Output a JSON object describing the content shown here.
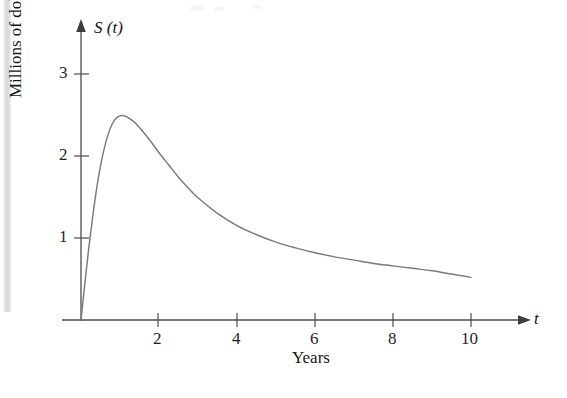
{
  "chart_data": {
    "type": "line",
    "title": "",
    "subtitle": "",
    "xlabel": "Years",
    "ylabel": "Millions of dollars",
    "x_axis_name": "t",
    "y_axis_name": "S (t)",
    "xlim": [
      0,
      11.4
    ],
    "ylim": [
      0,
      3.65
    ],
    "grid": false,
    "legend": null,
    "x_ticks": [
      {
        "value": 2,
        "label": "2"
      },
      {
        "value": 4,
        "label": "4"
      },
      {
        "value": 6,
        "label": "6"
      },
      {
        "value": 8,
        "label": "8"
      },
      {
        "value": 10,
        "label": "10"
      }
    ],
    "y_ticks": [
      {
        "value": 1,
        "label": "1"
      },
      {
        "value": 2,
        "label": "2"
      },
      {
        "value": 3,
        "label": "3"
      }
    ],
    "series": [
      {
        "name": "S (t)",
        "color": "#7a7a7a",
        "x": [
          0,
          0.1,
          0.2,
          0.3,
          0.4,
          0.5,
          0.6,
          0.7,
          0.8,
          0.9,
          1.0,
          1.1,
          1.2,
          1.4,
          1.6,
          1.8,
          2.0,
          2.25,
          2.5,
          2.75,
          3.0,
          3.5,
          4.0,
          4.5,
          5.0,
          5.5,
          6.0,
          6.5,
          7.0,
          7.5,
          8.0,
          8.5,
          9.0,
          9.5,
          10.0
        ],
        "y": [
          0,
          0.45,
          0.88,
          1.26,
          1.6,
          1.88,
          2.1,
          2.27,
          2.39,
          2.46,
          2.49,
          2.49,
          2.47,
          2.4,
          2.29,
          2.17,
          2.04,
          1.89,
          1.74,
          1.61,
          1.49,
          1.3,
          1.15,
          1.04,
          0.95,
          0.88,
          0.82,
          0.77,
          0.73,
          0.69,
          0.66,
          0.63,
          0.6,
          0.56,
          0.52
        ]
      }
    ],
    "annotations": {
      "peak": {
        "t": 1.05,
        "value": 2.49
      },
      "end": {
        "t": 10,
        "value": 0.52
      },
      "start": {
        "t": 0,
        "value": 0
      }
    }
  },
  "figure": {
    "x_axis_name": "t",
    "y_axis_name": "S (t)",
    "x_caption": "Years",
    "y_caption": "Millions of dollars",
    "tick_labels_x": [
      "2",
      "4",
      "6",
      "8",
      "10"
    ],
    "tick_labels_y": [
      "3",
      "2",
      "1"
    ],
    "colors": {
      "curve": "#7a7a7a",
      "axis": "#4d4d4d",
      "text": "#1f1f1f",
      "background": "#ffffff",
      "page_edge": "#d2d2d2"
    }
  }
}
